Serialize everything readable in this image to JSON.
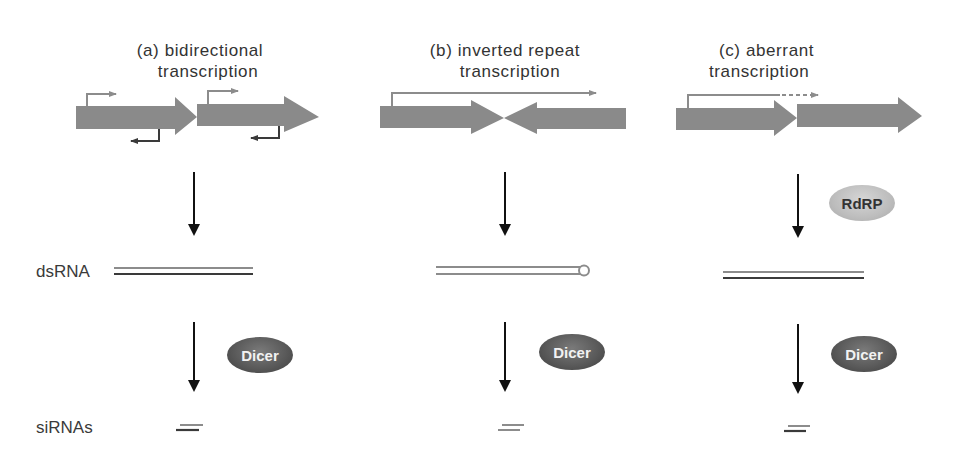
{
  "panels": [
    {
      "id": "a",
      "title_line1": "(a)  bidirectional",
      "title_line2": "transcription"
    },
    {
      "id": "b",
      "title_line1": "(b)  inverted repeat",
      "title_line2": "transcription"
    },
    {
      "id": "c",
      "title_line1": "(c)  aberrant",
      "title_line2": "transcription"
    }
  ],
  "row_labels": {
    "dsrna": "dsRNA",
    "sirnas": "siRNAs"
  },
  "enzymes": {
    "rdrp": "RdRP",
    "dicer": "Dicer"
  },
  "colors": {
    "gene_arrow": "#8a8a8a",
    "transcript_light": "#8c8c8c",
    "transcript_dark": "#3a3a3a",
    "flow_arrow": "#111111",
    "dicer": "#5a5a5a",
    "rdrp": "#bdbdbd"
  }
}
